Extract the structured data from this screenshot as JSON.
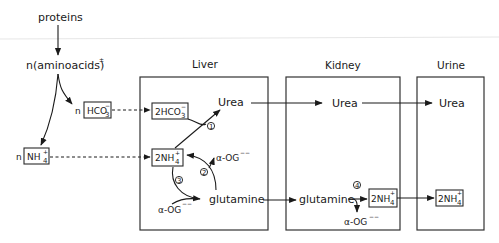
{
  "diagram": {
    "top_labels": {
      "proteins": "proteins",
      "aminoacids": "n(aminoacids)",
      "aminoacids_charge": "±"
    },
    "organs": [
      {
        "id": "liver",
        "label": "Liver"
      },
      {
        "id": "kidney",
        "label": "Kidney"
      },
      {
        "id": "urine",
        "label": "Urine"
      }
    ],
    "left_nodes": {
      "hco3_coef": "n",
      "hco3_label": "HCO",
      "hco3_sub": "3",
      "hco3_sup": "−",
      "nh4_coef": "n",
      "nh4_label": "NH",
      "nh4_sub": "4",
      "nh4_sup": "+"
    },
    "liver": {
      "hco3_box": "2HCO",
      "hco3_sub": "3",
      "hco3_sup": "−",
      "nh4_box": "2NH",
      "nh4_sub": "4",
      "nh4_sup": "+",
      "urea": "Urea",
      "glutamine": "glutamine",
      "aog_top": "α-OG",
      "aog_top_charge": "−−",
      "aog_bottom": "α-OG",
      "aog_bottom_charge": "−−",
      "step1": "1",
      "step2": "2",
      "step3": "3"
    },
    "kidney": {
      "urea": "Urea",
      "glutamine": "glutamine",
      "nh4_box": "2NH",
      "nh4_sub": "4",
      "nh4_sup": "+",
      "aog": "α-OG",
      "aog_charge": "−−",
      "step4": "4"
    },
    "urine": {
      "urea": "Urea",
      "nh4_box": "2NH",
      "nh4_sub": "4",
      "nh4_sup": "+"
    },
    "colors": {
      "ink": "#1a1a1a",
      "background": "#ffffff"
    }
  }
}
